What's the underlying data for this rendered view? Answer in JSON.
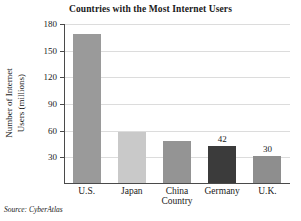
{
  "chart_data": {
    "type": "bar",
    "title": "Countries with the Most Internet Users",
    "xlabel": "Country",
    "ylabel_line1": "Number of Internet",
    "ylabel_line2": "Users (millions)",
    "ylabel": "Number of Internet Users (millions)",
    "categories": [
      "U.S.",
      "Japan",
      "China",
      "Germany",
      "U.K."
    ],
    "values": [
      168,
      57,
      47,
      42,
      30
    ],
    "value_labels": [
      "",
      "",
      "",
      "42",
      "30"
    ],
    "bar_colors": [
      "#9a9a9a",
      "#c9c9c9",
      "#949494",
      "#3b3b3b",
      "#8e8e8e"
    ],
    "yticks": [
      30,
      60,
      90,
      120,
      150,
      180
    ],
    "ytick_labels": [
      "30",
      "60",
      "90",
      "120",
      "150",
      "180"
    ],
    "ylim": [
      0,
      180
    ],
    "grid": true,
    "legend": "none",
    "source_note": "Source: CyberAtlas"
  }
}
